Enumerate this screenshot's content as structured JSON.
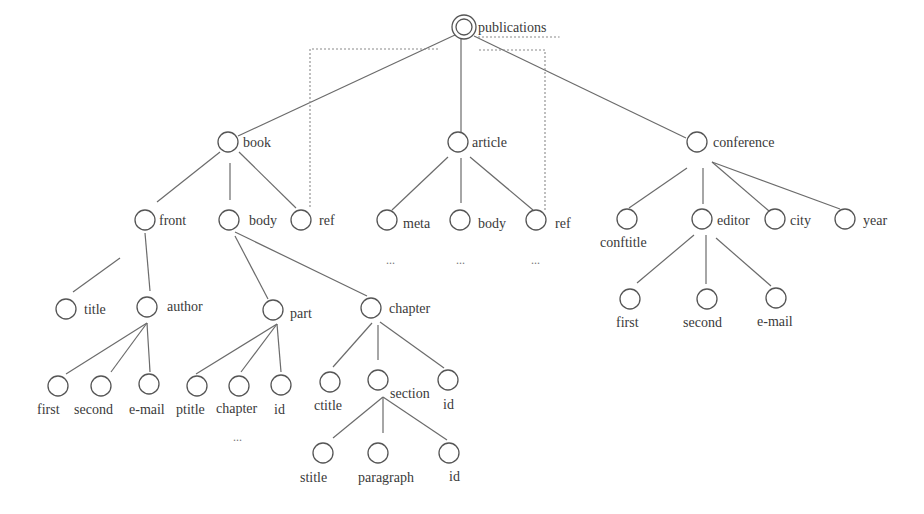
{
  "diagram": {
    "root": "publications",
    "nodes": [
      {
        "id": "publications",
        "label": "publications",
        "x": 464,
        "y": 27,
        "root": true,
        "lx": 478,
        "ly": 32
      },
      {
        "id": "book",
        "label": "book",
        "x": 228,
        "y": 142,
        "lx": 243,
        "ly": 147
      },
      {
        "id": "article",
        "label": "article",
        "x": 458,
        "y": 142,
        "lx": 472,
        "ly": 147
      },
      {
        "id": "conference",
        "label": "conference",
        "x": 697,
        "y": 142,
        "lx": 713,
        "ly": 147
      },
      {
        "id": "front",
        "label": "front",
        "x": 145,
        "y": 220,
        "lx": 159,
        "ly": 225
      },
      {
        "id": "book_body",
        "label": "body",
        "x": 229,
        "y": 220,
        "lx": 249,
        "ly": 225
      },
      {
        "id": "book_ref",
        "label": "ref",
        "x": 301,
        "y": 220,
        "lx": 319,
        "ly": 225
      },
      {
        "id": "meta",
        "label": "meta",
        "x": 387,
        "y": 220,
        "lx": 403,
        "ly": 228
      },
      {
        "id": "article_body",
        "label": "body",
        "x": 460,
        "y": 220,
        "lx": 478,
        "ly": 228
      },
      {
        "id": "article_ref",
        "label": "ref",
        "x": 536,
        "y": 220,
        "lx": 555,
        "ly": 228
      },
      {
        "id": "conftitle",
        "label": "conftitle",
        "x": 627,
        "y": 219,
        "lx": 600,
        "ly": 247
      },
      {
        "id": "editor",
        "label": "editor",
        "x": 702,
        "y": 219,
        "lx": 717,
        "ly": 225
      },
      {
        "id": "city",
        "label": "city",
        "x": 775,
        "y": 219,
        "lx": 790,
        "ly": 225
      },
      {
        "id": "year",
        "label": "year",
        "x": 845,
        "y": 219,
        "lx": 863,
        "ly": 225
      },
      {
        "id": "title",
        "label": "title",
        "x": 66,
        "y": 309,
        "lx": 84,
        "ly": 314
      },
      {
        "id": "author",
        "label": "author",
        "x": 147,
        "y": 307,
        "lx": 167,
        "ly": 311
      },
      {
        "id": "part",
        "label": "part",
        "x": 273,
        "y": 310,
        "lx": 290,
        "ly": 318
      },
      {
        "id": "chapter",
        "label": "chapter",
        "x": 371,
        "y": 308,
        "lx": 389,
        "ly": 313
      },
      {
        "id": "editor_first",
        "label": "first",
        "x": 630,
        "y": 299,
        "lx": 616,
        "ly": 327
      },
      {
        "id": "editor_second",
        "label": "second",
        "x": 707,
        "y": 299,
        "lx": 683,
        "ly": 327
      },
      {
        "id": "editor_email",
        "label": "e-mail",
        "x": 776,
        "y": 298,
        "lx": 757,
        "ly": 326
      },
      {
        "id": "author_first",
        "label": "first",
        "x": 58,
        "y": 386,
        "lx": 37,
        "ly": 414
      },
      {
        "id": "author_second",
        "label": "second",
        "x": 101,
        "y": 386,
        "lx": 74,
        "ly": 414
      },
      {
        "id": "author_email",
        "label": "e-mail",
        "x": 149,
        "y": 384,
        "lx": 129,
        "ly": 414
      },
      {
        "id": "ptitle",
        "label": "ptitle",
        "x": 197,
        "y": 386,
        "lx": 176,
        "ly": 414
      },
      {
        "id": "part_chapter",
        "label": "chapter",
        "x": 239,
        "y": 386,
        "lx": 216,
        "ly": 413
      },
      {
        "id": "part_id",
        "label": "id",
        "x": 281,
        "y": 385,
        "lx": 274,
        "ly": 414
      },
      {
        "id": "ctitle",
        "label": "ctitle",
        "x": 330,
        "y": 382,
        "lx": 314,
        "ly": 410
      },
      {
        "id": "section",
        "label": "section",
        "x": 378,
        "y": 380,
        "lx": 390,
        "ly": 398
      },
      {
        "id": "chapter_id",
        "label": "id",
        "x": 448,
        "y": 380,
        "lx": 443,
        "ly": 409
      },
      {
        "id": "stitle",
        "label": "stitle",
        "x": 323,
        "y": 453,
        "lx": 300,
        "ly": 482
      },
      {
        "id": "paragraph",
        "label": "paragraph",
        "x": 378,
        "y": 453,
        "lx": 358,
        "ly": 482
      },
      {
        "id": "section_id",
        "label": "id",
        "x": 449,
        "y": 453,
        "lx": 449,
        "ly": 481
      }
    ],
    "edges": [
      {
        "from": "publications",
        "to": "book",
        "x1": 455,
        "y1": 35,
        "x2": 238,
        "y2": 136
      },
      {
        "from": "publications",
        "to": "article",
        "x1": 461,
        "y1": 38,
        "x2": 461,
        "y2": 132
      },
      {
        "from": "publications",
        "to": "conference",
        "x1": 474,
        "y1": 36,
        "x2": 686,
        "y2": 138
      },
      {
        "from": "book",
        "to": "front",
        "x1": 220,
        "y1": 152,
        "x2": 157,
        "y2": 202
      },
      {
        "from": "book",
        "to": "book_body",
        "x1": 230,
        "y1": 163,
        "x2": 230,
        "y2": 200
      },
      {
        "from": "book",
        "to": "book_ref",
        "x1": 239,
        "y1": 152,
        "x2": 296,
        "y2": 208
      },
      {
        "from": "article",
        "to": "meta",
        "x1": 448,
        "y1": 157,
        "x2": 392,
        "y2": 210
      },
      {
        "from": "article",
        "to": "article_body",
        "x1": 461,
        "y1": 158,
        "x2": 461,
        "y2": 203
      },
      {
        "from": "article",
        "to": "article_ref",
        "x1": 470,
        "y1": 157,
        "x2": 533,
        "y2": 210
      },
      {
        "from": "conference",
        "to": "conftitle",
        "x1": 687,
        "y1": 168,
        "x2": 629,
        "y2": 208
      },
      {
        "from": "conference",
        "to": "editor",
        "x1": 703,
        "y1": 168,
        "x2": 703,
        "y2": 204
      },
      {
        "from": "conference",
        "to": "city",
        "x1": 712,
        "y1": 162,
        "x2": 769,
        "y2": 211
      },
      {
        "from": "conference",
        "to": "year",
        "x1": 712,
        "y1": 162,
        "x2": 840,
        "y2": 209
      },
      {
        "from": "front",
        "to": "title",
        "x1": 120,
        "y1": 258,
        "x2": 73,
        "y2": 292
      },
      {
        "from": "front",
        "to": "author",
        "x1": 145,
        "y1": 233,
        "x2": 150,
        "y2": 291
      },
      {
        "from": "book_body",
        "to": "part",
        "x1": 235,
        "y1": 236,
        "x2": 268,
        "y2": 299
      },
      {
        "from": "book_body",
        "to": "chapter",
        "x1": 235,
        "y1": 232,
        "x2": 367,
        "y2": 296
      },
      {
        "from": "author",
        "to": "author_first",
        "x1": 147,
        "y1": 323,
        "x2": 66,
        "y2": 374
      },
      {
        "from": "author",
        "to": "author_second",
        "x1": 147,
        "y1": 323,
        "x2": 111,
        "y2": 372
      },
      {
        "from": "author",
        "to": "author_email",
        "x1": 147,
        "y1": 323,
        "x2": 150,
        "y2": 372
      },
      {
        "from": "part",
        "to": "ptitle",
        "x1": 277,
        "y1": 324,
        "x2": 196,
        "y2": 374
      },
      {
        "from": "part",
        "to": "part_chapter",
        "x1": 277,
        "y1": 324,
        "x2": 241,
        "y2": 372
      },
      {
        "from": "part",
        "to": "part_id",
        "x1": 277,
        "y1": 324,
        "x2": 281,
        "y2": 372
      },
      {
        "from": "chapter",
        "to": "ctitle",
        "x1": 372,
        "y1": 323,
        "x2": 333,
        "y2": 367
      },
      {
        "from": "chapter",
        "to": "section",
        "x1": 378,
        "y1": 325,
        "x2": 378,
        "y2": 360
      },
      {
        "from": "chapter",
        "to": "chapter_id",
        "x1": 380,
        "y1": 322,
        "x2": 444,
        "y2": 368
      },
      {
        "from": "section",
        "to": "stitle",
        "x1": 383,
        "y1": 397,
        "x2": 333,
        "y2": 438
      },
      {
        "from": "section",
        "to": "paragraph",
        "x1": 383,
        "y1": 397,
        "x2": 383,
        "y2": 433
      },
      {
        "from": "section",
        "to": "section_id",
        "x1": 383,
        "y1": 397,
        "x2": 447,
        "y2": 440
      },
      {
        "from": "editor",
        "to": "editor_first",
        "x1": 694,
        "y1": 235,
        "x2": 637,
        "y2": 283
      },
      {
        "from": "editor",
        "to": "editor_second",
        "x1": 706,
        "y1": 235,
        "x2": 706,
        "y2": 284
      },
      {
        "from": "editor",
        "to": "editor_email",
        "x1": 716,
        "y1": 238,
        "x2": 771,
        "y2": 286
      }
    ],
    "ref_links": [
      {
        "from": "book_ref",
        "to": "publications",
        "points": "310,207 310,49 440,49"
      },
      {
        "from": "article_ref",
        "to": "publications",
        "points": "545,210 545,50 478,50"
      }
    ],
    "ellipses": [
      {
        "text": "...",
        "x": 386,
        "y": 264
      },
      {
        "text": "...",
        "x": 456,
        "y": 264
      },
      {
        "text": "...",
        "x": 531,
        "y": 264
      },
      {
        "text": "...",
        "x": 233,
        "y": 441
      }
    ]
  }
}
